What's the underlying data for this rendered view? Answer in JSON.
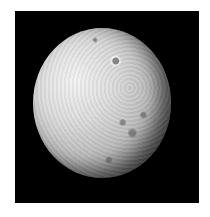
{
  "image": {
    "subject": "cratered moon",
    "background_color": "#000000",
    "border_color": "#ffffff"
  }
}
